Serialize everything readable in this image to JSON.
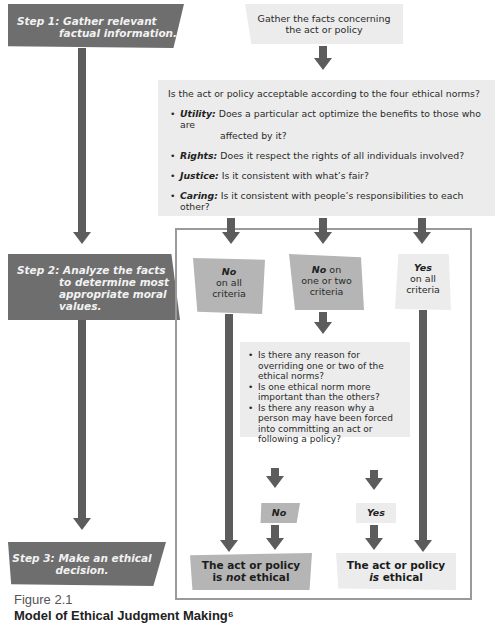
{
  "steps": [
    {
      "line1": "Step 1: Gather relevant",
      "line2": "factual information."
    },
    {
      "line1": "Step 2: Analyze the facts",
      "line2": "to determine most",
      "line3": "appropriate moral",
      "line4": "values."
    },
    {
      "line1": "Step 3: Make an ethical",
      "line2": "decision."
    }
  ],
  "gather_box": {
    "line1": "Gather the facts concerning",
    "line2": "the act or policy"
  },
  "norms_box": {
    "question": "Is the act or policy acceptable according to the four ethical norms?",
    "norms": [
      {
        "term": "Utility:",
        "text": "Does a particular act optimize the benefits to those who are",
        "text2": "affected by it?"
      },
      {
        "term": "Rights:",
        "text": "Does it respect the rights of all individuals involved?"
      },
      {
        "term": "Justice:",
        "text": "Is it consistent with what’s fair?"
      },
      {
        "term": "Caring:",
        "text": "Is it consistent with people’s responsibilities to each other?"
      }
    ]
  },
  "outcomes": [
    {
      "head": "No",
      "line1": "on all",
      "line2": "criteria"
    },
    {
      "head": "No",
      "head_suffix": " on",
      "line1": "one or two",
      "line2": "criteria"
    },
    {
      "head": "Yes",
      "line1": "on all",
      "line2": "criteria"
    }
  ],
  "questions_box": {
    "items": [
      "Is there any reason for overriding one or two of the ethical norms?",
      "Is one ethical norm more important than the others?",
      "Is there any reason why a person may have been forced into committing an act or following a policy?"
    ]
  },
  "answers": {
    "no": "No",
    "yes": "Yes"
  },
  "results": {
    "not_ethical": {
      "line1": "The act or policy",
      "pre": "is ",
      "em": "not",
      "post": " ethical"
    },
    "ethical": {
      "line1": "The act or policy",
      "em": "is",
      "post": " ethical"
    }
  },
  "caption": {
    "figure": "Figure 2.1",
    "title": "Model of Ethical Judgment Making⁶"
  }
}
